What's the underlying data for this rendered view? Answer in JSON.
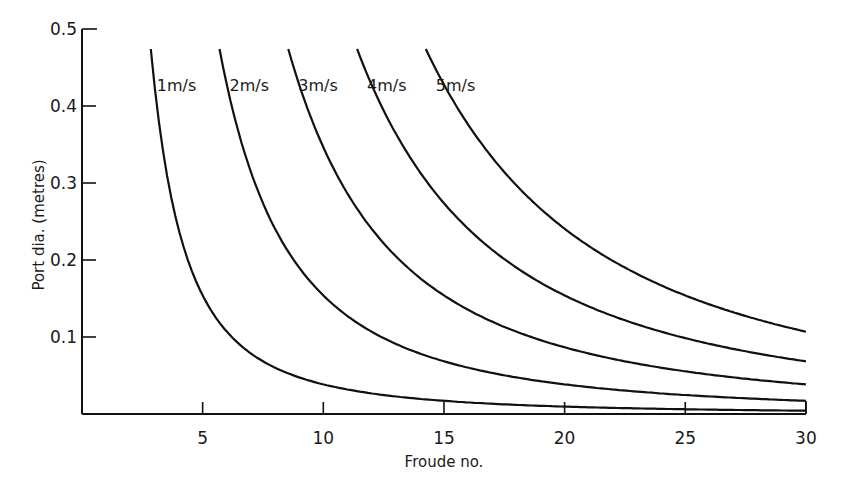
{
  "chart_data": {
    "type": "line",
    "title": "",
    "xlabel": "Froude no.",
    "ylabel": "Port dia. (metres)",
    "xlim": [
      0,
      30
    ],
    "ylim": [
      0,
      0.5
    ],
    "x_ticks": [
      5,
      10,
      15,
      20,
      25,
      30
    ],
    "x_tick_labels": [
      "5",
      "10",
      "15",
      "20",
      "25",
      "30"
    ],
    "y_ticks": [
      0.1,
      0.2,
      0.3,
      0.4,
      0.5
    ],
    "y_tick_labels": [
      "0.1",
      "0.2",
      "0.3",
      "0.4",
      "0.5"
    ],
    "grid": false,
    "legend": "inline labels at top of each curve",
    "note": "Values read from plotted curves; consistent with empirical fit D ≈ 3.85·V²/Fr²",
    "series": [
      {
        "name": "1m/s",
        "velocity": 1,
        "x": [
          2.85,
          3,
          4,
          5,
          6,
          8,
          10,
          15,
          20,
          25,
          30
        ],
        "y": [
          0.474,
          0.428,
          0.241,
          0.154,
          0.107,
          0.06,
          0.039,
          0.017,
          0.01,
          0.006,
          0.004
        ]
      },
      {
        "name": "2m/s",
        "velocity": 2,
        "x": [
          5.7,
          6,
          8,
          10,
          12,
          15,
          20,
          25,
          30
        ],
        "y": [
          0.474,
          0.428,
          0.241,
          0.154,
          0.107,
          0.068,
          0.039,
          0.025,
          0.017
        ]
      },
      {
        "name": "3m/s",
        "velocity": 3,
        "x": [
          8.55,
          10,
          12,
          15,
          20,
          25,
          30
        ],
        "y": [
          0.474,
          0.347,
          0.241,
          0.154,
          0.087,
          0.055,
          0.039
        ]
      },
      {
        "name": "4m/s",
        "velocity": 4,
        "x": [
          11.4,
          12,
          15,
          20,
          25,
          30
        ],
        "y": [
          0.474,
          0.428,
          0.274,
          0.154,
          0.099,
          0.068
        ]
      },
      {
        "name": "5m/s",
        "velocity": 5,
        "x": [
          14.25,
          15,
          20,
          25,
          30
        ],
        "y": [
          0.474,
          0.428,
          0.241,
          0.154,
          0.107
        ]
      }
    ],
    "fit_constant_k": 3.85
  },
  "labels": {
    "xlabel": "Froude no.",
    "ylabel": "Port dia. (metres)",
    "series": [
      "1m/s",
      "2m/s",
      "3m/s",
      "4m/s",
      "5m/s"
    ],
    "x_ticks": [
      "5",
      "10",
      "15",
      "20",
      "25",
      "30"
    ],
    "y_ticks": [
      "0.1",
      "0.2",
      "0.3",
      "0.4",
      "0.5"
    ]
  }
}
